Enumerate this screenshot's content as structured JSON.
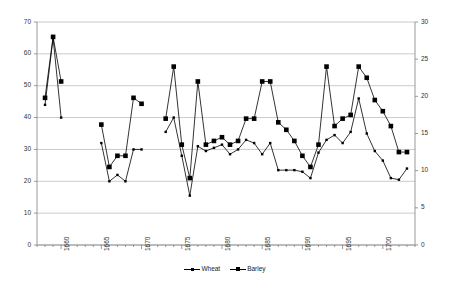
{
  "chart_data": {
    "type": "line",
    "title": "",
    "subtitle": "",
    "xlabel": "",
    "ylabel": "",
    "grid": true,
    "legend_position": "bottom",
    "x": [
      1658,
      1659,
      1660,
      1661,
      1665,
      1666,
      1667,
      1668,
      1669,
      1670,
      1671,
      1673,
      1674,
      1675,
      1676,
      1677,
      1678,
      1679,
      1680,
      1681,
      1682,
      1683,
      1684,
      1685,
      1686,
      1687,
      1688,
      1689,
      1690,
      1691,
      1692,
      1693,
      1694,
      1695,
      1696,
      1697,
      1698,
      1699,
      1700,
      1701,
      1702,
      1703
    ],
    "xlim": [
      1657,
      1704
    ],
    "xticks": [
      1660,
      1665,
      1670,
      1675,
      1680,
      1685,
      1690,
      1695,
      1700
    ],
    "xtick_labels": [
      "1660",
      "1665",
      "1670",
      "1675",
      "1680",
      "1685",
      "1690",
      "1695",
      "1700"
    ],
    "x_minor_tick_interval": 1,
    "left_axis": {
      "ylim": [
        0,
        70
      ],
      "yticks": [
        0,
        10,
        20,
        30,
        40,
        50,
        60,
        70
      ],
      "ytick_labels": [
        "0",
        "10",
        "20",
        "30",
        "40",
        "50",
        "60",
        "70"
      ]
    },
    "right_axis": {
      "ylim": [
        0,
        30
      ],
      "yticks": [
        0,
        5,
        10,
        15,
        20,
        25,
        30
      ],
      "ytick_labels": [
        "0",
        "5",
        "10",
        "15",
        "20",
        "25",
        "30"
      ]
    },
    "series": [
      {
        "name": "Wheat",
        "axis": "left",
        "color": "#000000",
        "marker": "small-square",
        "values": [
          44.0,
          65.0,
          40.0,
          null,
          32.0,
          20.0,
          22.0,
          20.0,
          30.0,
          30.0,
          null,
          35.5,
          40.0,
          28.0,
          15.5,
          31.0,
          29.5,
          30.5,
          31.5,
          28.5,
          30.0,
          33.0,
          32.0,
          28.5,
          32.0,
          23.5,
          23.5,
          23.5,
          23.0,
          21.0,
          29.0,
          33.0,
          34.5,
          32.0,
          35.5,
          46.0,
          35.0,
          29.5,
          26.5,
          21.0,
          20.5,
          24.0
        ]
      },
      {
        "name": "Barley",
        "axis": "right",
        "color": "#000000",
        "marker": "large-square",
        "values": [
          19.8,
          28.0,
          22.0,
          null,
          16.2,
          10.5,
          12.0,
          12.0,
          19.8,
          19.0,
          null,
          17.0,
          24.0,
          13.5,
          9.0,
          22.0,
          13.5,
          14.0,
          14.5,
          13.5,
          14.0,
          17.0,
          17.0,
          22.0,
          22.0,
          16.5,
          15.5,
          14.0,
          12.0,
          10.5,
          13.5,
          24.0,
          16.0,
          17.0,
          17.5,
          24.0,
          22.5,
          19.5,
          18.0,
          16.0,
          12.5,
          12.5
        ]
      }
    ]
  },
  "legend": {
    "entries": [
      {
        "label": "Wheat",
        "marker": "small-square-line-marker"
      },
      {
        "label": "Barley",
        "marker": "large-square-line-marker"
      }
    ]
  },
  "colors": {
    "plot_background": "#ffffff",
    "gridline": "#b3b3b3",
    "axis_line": "#808080",
    "series": "#000000",
    "tick_text": "#333333"
  }
}
